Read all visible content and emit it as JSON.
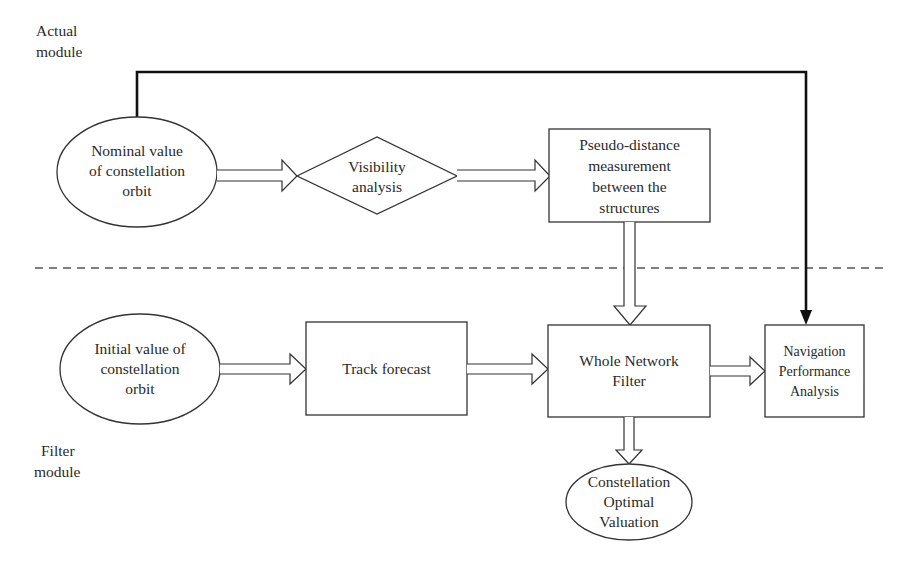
{
  "modules": {
    "actual": "Actual module",
    "actual_line1": "Actual",
    "actual_line2": "module",
    "filter_line1": "Filter",
    "filter_line2": "module"
  },
  "nodes": {
    "nominal": {
      "shape": "ellipse",
      "lines": [
        "Nominal value",
        "of constellation",
        "orbit"
      ]
    },
    "visibility": {
      "shape": "diamond",
      "lines": [
        "Visibility",
        "analysis"
      ]
    },
    "pseudo": {
      "shape": "rectangle",
      "lines": [
        "Pseudo-distance",
        "measurement",
        "between the",
        "structures"
      ]
    },
    "initial": {
      "shape": "ellipse",
      "lines": [
        "Initial value of",
        "constellation",
        "orbit"
      ]
    },
    "track": {
      "shape": "rectangle",
      "lines": [
        "Track forecast"
      ]
    },
    "whole": {
      "shape": "rectangle",
      "lines": [
        "Whole Network",
        "Filter"
      ]
    },
    "navigation": {
      "shape": "rectangle",
      "lines": [
        "Navigation",
        "Performance",
        "Analysis"
      ]
    },
    "optimal": {
      "shape": "ellipse",
      "lines": [
        "Constellation",
        "Optimal",
        "Valuation"
      ]
    }
  },
  "edges": [
    {
      "from": "nominal",
      "to": "visibility",
      "style": "hollow-arrow"
    },
    {
      "from": "visibility",
      "to": "pseudo",
      "style": "hollow-arrow"
    },
    {
      "from": "pseudo",
      "to": "whole",
      "style": "hollow-arrow"
    },
    {
      "from": "nominal",
      "to": "navigation",
      "style": "solid-line-arrow"
    },
    {
      "from": "initial",
      "to": "track",
      "style": "hollow-arrow"
    },
    {
      "from": "track",
      "to": "whole",
      "style": "hollow-arrow"
    },
    {
      "from": "whole",
      "to": "navigation",
      "style": "hollow-arrow"
    },
    {
      "from": "whole",
      "to": "optimal",
      "style": "hollow-arrow"
    }
  ],
  "divider": {
    "style": "dashed"
  },
  "colors": {
    "stroke": "#333333",
    "background": "#ffffff"
  }
}
